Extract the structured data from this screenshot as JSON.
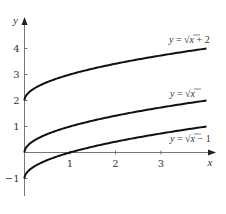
{
  "chart_data": {
    "type": "line",
    "title": "",
    "xlabel": "x",
    "ylabel": "y",
    "xlim": [
      0,
      4
    ],
    "ylim": [
      -1.6,
      5.2
    ],
    "grid": false,
    "legend": "inline labels at right end of curves",
    "x_ticks": [
      1,
      2,
      3
    ],
    "x_tick_labels": [
      "1",
      "2",
      "3"
    ],
    "y_ticks": [
      -1,
      1,
      2,
      3,
      4
    ],
    "y_tick_labels": [
      "-1",
      "1",
      "2",
      "3",
      "4"
    ],
    "series": [
      {
        "name": "y = √x + 2",
        "label_parts": [
          "y",
          " = √",
          "x",
          " + 2"
        ],
        "function": "sqrt(x) + 2",
        "x": [
          0,
          0.25,
          0.5,
          1,
          1.5,
          2,
          2.5,
          3,
          3.5,
          4
        ],
        "values": [
          2,
          2.5,
          2.71,
          3,
          3.22,
          3.41,
          3.58,
          3.73,
          3.87,
          4
        ]
      },
      {
        "name": "y = √x",
        "label_parts": [
          "y",
          " = √",
          "x",
          ""
        ],
        "function": "sqrt(x)",
        "x": [
          0,
          0.25,
          0.5,
          1,
          1.5,
          2,
          2.5,
          3,
          3.5,
          4
        ],
        "values": [
          0,
          0.5,
          0.71,
          1,
          1.22,
          1.41,
          1.58,
          1.73,
          1.87,
          2
        ]
      },
      {
        "name": "y = √x − 1",
        "label_parts": [
          "y",
          " = √",
          "x",
          " − 1"
        ],
        "function": "sqrt(x) - 1",
        "x": [
          0,
          0.25,
          0.5,
          1,
          1.5,
          2,
          2.5,
          3,
          3.5,
          4
        ],
        "values": [
          -1,
          -0.5,
          -0.29,
          0,
          0.22,
          0.41,
          0.58,
          0.73,
          0.87,
          1
        ]
      }
    ]
  },
  "layout": {
    "origin_px": [
      24.5,
      152.5
    ],
    "unit_x_px": 45.5,
    "unit_y_px": 26,
    "x_axis_end_px": 216,
    "y_axis_top_px": 17,
    "y_axis_bottom_px": 196,
    "label_positions": [
      [
        169,
        43
      ],
      [
        170,
        97
      ],
      [
        170,
        142
      ]
    ],
    "curve_color": "#111111",
    "axis_color": "#555555"
  }
}
